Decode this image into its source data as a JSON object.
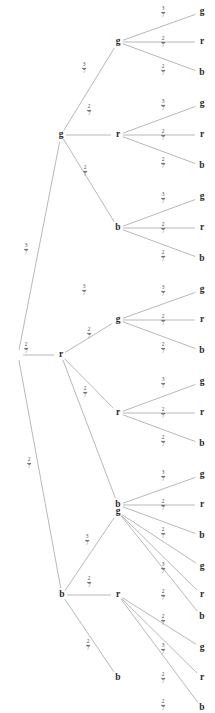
{
  "figure": {
    "type": "probability-tree-diagram",
    "title": "",
    "top_cropped_text": "",
    "width": 215,
    "height": 713,
    "background_color": "#ffffff",
    "edge_color": "#7d7d7d",
    "label_color": "#2b2b2b",
    "fraction_color": "#4a4a4a",
    "levels": 3,
    "branching_factor": 3,
    "outcome_symbols": [
      "g",
      "r",
      "b"
    ],
    "probabilities": [
      "3/7",
      "2/7",
      "2/7"
    ],
    "root": {
      "label": "",
      "x": 18,
      "y": 355
    },
    "level1": [
      {
        "label": "g",
        "x": 61,
        "y": 135,
        "prob_num": "3",
        "prob_den": "7",
        "prob_x": 26,
        "prob_y": 249
      },
      {
        "label": "r",
        "x": 61,
        "y": 355,
        "prob_num": "2",
        "prob_den": "7",
        "prob_x": 26,
        "prob_y": 348
      },
      {
        "label": "b",
        "x": 62,
        "y": 595,
        "prob_num": "2",
        "prob_den": "7",
        "prob_x": 29,
        "prob_y": 463
      }
    ],
    "level2": [
      {
        "label": "g",
        "x": 118,
        "y": 42,
        "parent": 0,
        "prob_num": "3",
        "prob_den": "7",
        "prob_x": 84,
        "prob_y": 68
      },
      {
        "label": "r",
        "x": 118,
        "y": 135,
        "parent": 0,
        "prob_num": "2",
        "prob_den": "7",
        "prob_x": 89,
        "prob_y": 110
      },
      {
        "label": "b",
        "x": 118,
        "y": 228,
        "parent": 0,
        "prob_num": "2",
        "prob_den": "7",
        "prob_x": 85,
        "prob_y": 171
      },
      {
        "label": "g",
        "x": 118,
        "y": 320,
        "parent": 1,
        "prob_num": "3",
        "prob_den": "7",
        "prob_x": 84,
        "prob_y": 290
      },
      {
        "label": "r",
        "x": 118,
        "y": 413,
        "parent": 1,
        "prob_num": "2",
        "prob_den": "7",
        "prob_x": 89,
        "prob_y": 333
      },
      {
        "label": "b",
        "x": 118,
        "y": 505,
        "parent": 1,
        "prob_num": "2",
        "prob_den": "7",
        "prob_x": 85,
        "prob_y": 392
      },
      {
        "label": "g",
        "x": 118,
        "y": 512,
        "parent": 2,
        "prob_num": "3",
        "prob_den": "7",
        "prob_x": 87,
        "prob_y": 540
      },
      {
        "label": "r",
        "x": 118,
        "y": 595,
        "parent": 2,
        "prob_num": "2",
        "prob_den": "7",
        "prob_x": 89,
        "prob_y": 582
      },
      {
        "label": "b",
        "x": 118,
        "y": 678,
        "parent": 2,
        "prob_num": "2",
        "prob_den": "7",
        "prob_x": 88,
        "prob_y": 645
      }
    ],
    "leaves": [
      {
        "label": "g",
        "x": 202,
        "y": 12,
        "prob_num": "3",
        "prob_den": "7",
        "prob_x": 163,
        "prob_y": 12
      },
      {
        "label": "r",
        "x": 202,
        "y": 42,
        "prob_num": "2",
        "prob_den": "7",
        "prob_x": 163,
        "prob_y": 42
      },
      {
        "label": "b",
        "x": 202,
        "y": 73,
        "prob_num": "2",
        "prob_den": "7",
        "prob_x": 163,
        "prob_y": 70
      },
      {
        "label": "g",
        "x": 202,
        "y": 104,
        "prob_num": "3",
        "prob_den": "7",
        "prob_x": 163,
        "prob_y": 105
      },
      {
        "label": "r",
        "x": 202,
        "y": 135,
        "prob_num": "2",
        "prob_den": "7",
        "prob_x": 163,
        "prob_y": 135
      },
      {
        "label": "b",
        "x": 202,
        "y": 166,
        "prob_num": "2",
        "prob_den": "7",
        "prob_x": 163,
        "prob_y": 163
      },
      {
        "label": "g",
        "x": 202,
        "y": 197,
        "prob_num": "3",
        "prob_den": "7",
        "prob_x": 163,
        "prob_y": 198
      },
      {
        "label": "r",
        "x": 202,
        "y": 228,
        "prob_num": "2",
        "prob_den": "7",
        "prob_x": 163,
        "prob_y": 228
      },
      {
        "label": "b",
        "x": 202,
        "y": 259,
        "prob_num": "2",
        "prob_den": "7",
        "prob_x": 163,
        "prob_y": 256
      },
      {
        "label": "g",
        "x": 202,
        "y": 290,
        "prob_num": "3",
        "prob_den": "7",
        "prob_x": 163,
        "prob_y": 291
      },
      {
        "label": "r",
        "x": 202,
        "y": 320,
        "prob_num": "2",
        "prob_den": "7",
        "prob_x": 163,
        "prob_y": 320
      },
      {
        "label": "b",
        "x": 202,
        "y": 351,
        "prob_num": "2",
        "prob_den": "7",
        "prob_x": 163,
        "prob_y": 348
      },
      {
        "label": "g",
        "x": 202,
        "y": 382,
        "prob_num": "3",
        "prob_den": "7",
        "prob_x": 163,
        "prob_y": 383
      },
      {
        "label": "r",
        "x": 202,
        "y": 413,
        "prob_num": "2",
        "prob_den": "7",
        "prob_x": 163,
        "prob_y": 413
      },
      {
        "label": "b",
        "x": 202,
        "y": 444,
        "prob_num": "2",
        "prob_den": "7",
        "prob_x": 163,
        "prob_y": 441
      },
      {
        "label": "g",
        "x": 202,
        "y": 475,
        "prob_num": "3",
        "prob_den": "7",
        "prob_x": 163,
        "prob_y": 476
      },
      {
        "label": "r",
        "x": 202,
        "y": 505,
        "prob_num": "2",
        "prob_den": "7",
        "prob_x": 163,
        "prob_y": 505
      },
      {
        "label": "b",
        "x": 202,
        "y": 536,
        "prob_num": "2",
        "prob_den": "7",
        "prob_x": 163,
        "prob_y": 533
      },
      {
        "label": "g",
        "x": 202,
        "y": 567,
        "prob_num": "3",
        "prob_den": "7",
        "prob_x": 163,
        "prob_y": 568
      },
      {
        "label": "r",
        "x": 202,
        "y": 595,
        "prob_num": "2",
        "prob_den": "7",
        "prob_x": 163,
        "prob_y": 595
      },
      {
        "label": "b",
        "x": 202,
        "y": 617,
        "prob_num": "2",
        "prob_den": "7",
        "prob_x": 163,
        "prob_y": 620
      },
      {
        "label": "g",
        "x": 202,
        "y": 648,
        "prob_num": "3",
        "prob_den": "7",
        "prob_x": 163,
        "prob_y": 649
      },
      {
        "label": "r",
        "x": 202,
        "y": 678,
        "prob_num": "2",
        "prob_den": "7",
        "prob_x": 163,
        "prob_y": 678
      },
      {
        "label": "b",
        "x": 202,
        "y": 708,
        "prob_num": "2",
        "prob_den": "7",
        "prob_x": 163,
        "prob_y": 705
      }
    ]
  }
}
